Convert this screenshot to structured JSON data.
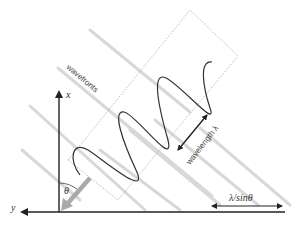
{
  "diagram": {
    "title": "",
    "labels": {
      "wavefronts": "wavefronts",
      "wavelength": "wavelength λ",
      "lambda_over_sin": "λ/sinθ",
      "theta": "θ",
      "x_axis": "x",
      "y_axis": "y"
    },
    "colors": {
      "axis": "#222222",
      "wave": "#333333",
      "wavefront": "#d6d6d6",
      "dotted_box": "#aaaaaa",
      "direction_arrow": "#a9a9a9"
    }
  }
}
